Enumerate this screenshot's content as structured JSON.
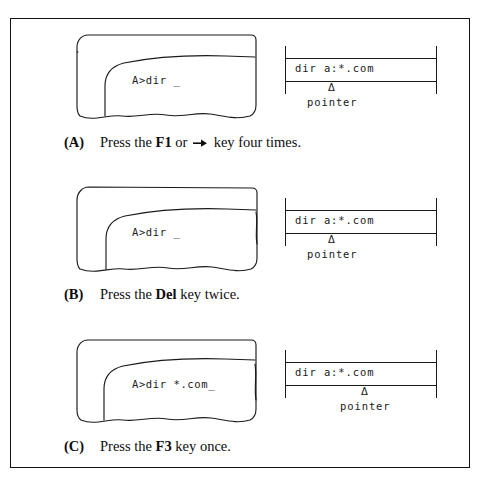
{
  "figure": {
    "panels": [
      {
        "id": "a",
        "tag": "(A)",
        "screen_text": "A>dir _",
        "buffer_text": "dir a:*.com",
        "pointer_glyph": "Δ",
        "pointer_label": "pointer",
        "pointer_offset_px": 43,
        "caption_before": "Press the ",
        "caption_key": "F1",
        "caption_mid": " or ",
        "caption_icon": "right-arrow-icon",
        "caption_after": " key four times."
      },
      {
        "id": "b",
        "tag": "(B)",
        "screen_text": "A>dir _",
        "buffer_text": "dir a:*.com",
        "pointer_glyph": "Δ",
        "pointer_label": "pointer",
        "pointer_offset_px": 43,
        "caption_before": "Press the ",
        "caption_key": "Del",
        "caption_mid": "",
        "caption_icon": "",
        "caption_after": " key twice."
      },
      {
        "id": "c",
        "tag": "(C)",
        "screen_text": "A>dir *.com_",
        "buffer_text": "dir a:*.com",
        "pointer_glyph": "Δ",
        "pointer_label": "pointer",
        "pointer_offset_px": 76,
        "caption_before": "Press the ",
        "caption_key": "F3",
        "caption_mid": "",
        "caption_icon": "",
        "caption_after": " key once."
      }
    ],
    "colors": {
      "ink": "#1a1a1a",
      "frame": "#111111",
      "paper": "#ffffff"
    }
  }
}
